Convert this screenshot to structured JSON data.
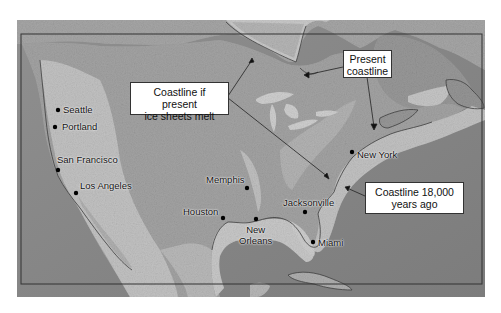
{
  "map": {
    "title": "",
    "region": "North America",
    "palette": {
      "ocean": "#8a8a8a",
      "deep_ocean": "#7a7a7a",
      "shelf": "#bdbdbd",
      "land": "#9c9c9c",
      "mountains": "#c4c4c4",
      "ice_melt_zone": "#d8d8d8",
      "frame": "#333333",
      "callout_bg": "#ffffff"
    },
    "callouts": [
      {
        "id": "ice-sheets-melt",
        "lines": [
          "Coastline if present",
          "ice sheets melt"
        ]
      },
      {
        "id": "present-coastline",
        "lines": [
          "Present",
          "coastline"
        ]
      },
      {
        "id": "coastline-18000",
        "lines": [
          "Coastline 18,000",
          "years ago"
        ]
      }
    ],
    "cities": [
      {
        "name": "Seattle"
      },
      {
        "name": "Portland"
      },
      {
        "name": "San Francisco"
      },
      {
        "name": "Los Angeles"
      },
      {
        "name": "Memphis"
      },
      {
        "name": "Houston"
      },
      {
        "name": "New Orleans",
        "lines": [
          "New",
          "Orleans"
        ]
      },
      {
        "name": "Jacksonville"
      },
      {
        "name": "Miami"
      },
      {
        "name": "New York"
      }
    ]
  }
}
